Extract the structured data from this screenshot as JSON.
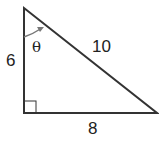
{
  "diagram": {
    "type": "right-triangle",
    "sides": {
      "vertical": "6",
      "hypotenuse": "10",
      "horizontal": "8"
    },
    "angle_label": "θ",
    "right_angle_marker": true,
    "stroke_color": "#333333",
    "arrow_color": "#777777"
  }
}
